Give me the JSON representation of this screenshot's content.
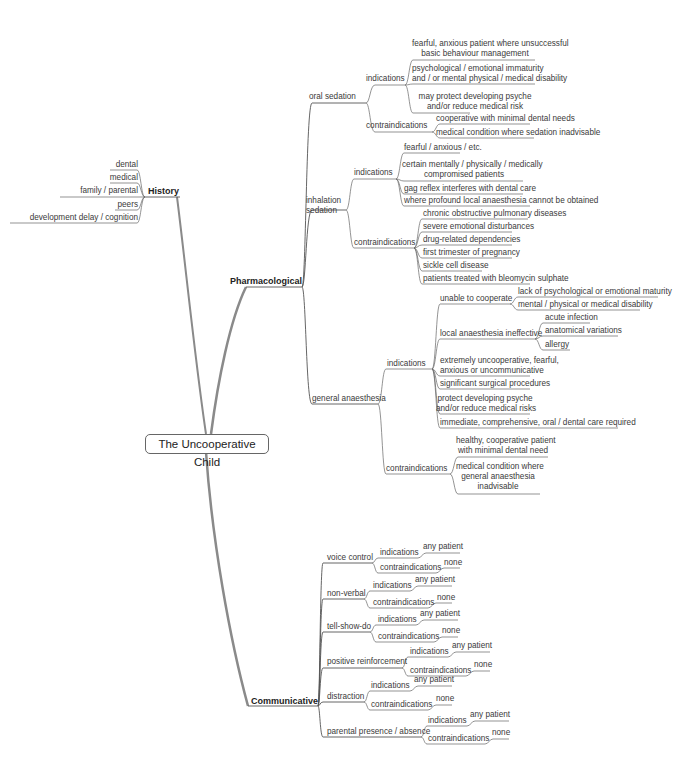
{
  "root": "The Uncooperative Child",
  "history": {
    "label": "History",
    "items": [
      "dental",
      "medical",
      "family / parental",
      "peers",
      "development delay / cognition"
    ]
  },
  "pharmacological": {
    "label": "Pharmacological",
    "oral_sedation": {
      "label": "oral sedation",
      "indications_label": "indications",
      "indications": [
        "fearful, anxious patient where unsuccessful basic behaviour management",
        "psychological  / emotional immaturity and / or mental physical / medical disability",
        "may protect developing psyche and/or reduce medical risk"
      ],
      "contraindications_label": "contraindications",
      "contraindications": [
        "cooperative with minimal dental needs",
        "medical condition where sedation inadvisable"
      ]
    },
    "inhalation_sedation": {
      "label": "inhalation sedation",
      "indications_label": "indications",
      "indications": [
        "fearful / anxious / etc.",
        "certain mentally / physically / medically compromised patients",
        "gag reflex interferes with dental care",
        "where profound local anaesthesia cannot be obtained"
      ],
      "contraindications_label": "contraindications",
      "contraindications": [
        "chronic obstructive pulmonary diseases",
        "severe emotional disturbances",
        "drug-related dependencies",
        "first trimester of pregnancy",
        "sickle cell disease",
        "patients treated with bleomycin sulphate"
      ]
    },
    "general_anaesthesia": {
      "label": "general anaesthesia",
      "indications_label": "indications",
      "indications": {
        "unable_to_cooperate": {
          "label": "unable to cooperate",
          "items": [
            "lack of psychological or emotional maturity",
            "mental / physical or medical disability"
          ]
        },
        "la_ineffective": {
          "label": "local anaesthesia ineffective",
          "items": [
            "acute infection",
            "anatomical variations",
            "allergy"
          ]
        },
        "others": [
          "extremely uncooperative, fearful, anxious or uncommunicative",
          "significant surgical procedures",
          "protect developing psyche and/or reduce medical risks",
          "immediate, comprehensive, oral / dental care required"
        ]
      },
      "contraindications_label": "contraindications",
      "contraindications": [
        "healthy, cooperative patient with minimal dental need",
        "medical condition where general anaesthesia inadvisable"
      ]
    }
  },
  "communicative": {
    "label": "Communicative",
    "techniques": [
      {
        "label": "voice control",
        "indications": "indications",
        "ind_value": "any patient",
        "contraindications": "contraindications",
        "contra_value": "none"
      },
      {
        "label": "non-verbal",
        "indications": "indications",
        "ind_value": "any patient",
        "contraindications": "contraindications",
        "contra_value": "none"
      },
      {
        "label": "tell-show-do",
        "indications": "indications",
        "ind_value": "any patient",
        "contraindications": "contraindications",
        "contra_value": "none"
      },
      {
        "label": "positive reinforcement",
        "indications": "indications",
        "ind_value": "any patient",
        "contraindications": "contraindications",
        "contra_value": "none"
      },
      {
        "label": "distraction",
        "indications": "indications",
        "ind_value": "any patient",
        "contraindications": "contraindications",
        "contra_value": "none"
      },
      {
        "label": "parental presence / absence",
        "indications": "indications",
        "ind_value": "any patient",
        "contraindications": "contraindications",
        "contra_value": "none"
      }
    ]
  },
  "text": {
    "os_ind_1a": "fearful, anxious patient where unsuccessful",
    "os_ind_1b": "basic behaviour management",
    "os_ind_2a": "psychological  / emotional immaturity",
    "os_ind_2b": "and / or mental physical / medical disability",
    "os_ind_3a": "may protect developing psyche",
    "os_ind_3b": "and/or reduce medical risk",
    "is_label_a": "inhalation",
    "is_label_b": "sedation",
    "is_ind_2a": "certain mentally / physically / medically",
    "is_ind_2b": "compromised patients",
    "ga_ind_o1a": "extremely uncooperative, fearful,",
    "ga_ind_o1b": "anxious or uncommunicative",
    "ga_ind_o3a": "protect developing psyche",
    "ga_ind_o3b": "and/or reduce medical risks",
    "ga_con_1a": "healthy, cooperative patient",
    "ga_con_1b": "with minimal dental need",
    "ga_con_2a": "medical condition where",
    "ga_con_2b": "general anaesthesia",
    "ga_con_2c": "inadvisable"
  },
  "colors": {
    "line": "#555555",
    "trunk": "#8a8a8a",
    "text": "#3a3a3a",
    "background": "#ffffff"
  }
}
